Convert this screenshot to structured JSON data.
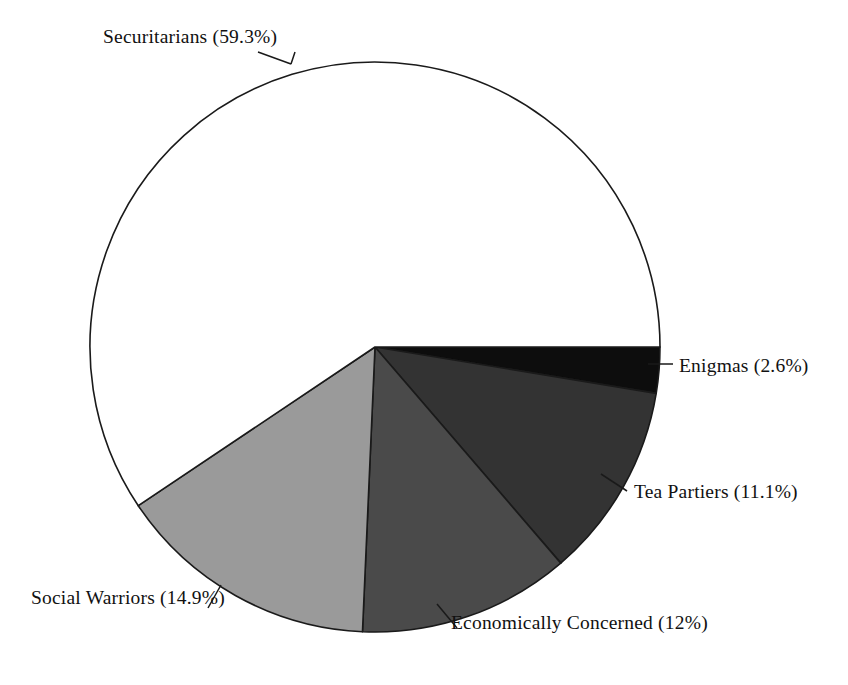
{
  "chart_data": {
    "type": "pie",
    "title": "",
    "subtitle": "",
    "xlabel": "",
    "ylabel": "",
    "legend_position": "none",
    "grid": false,
    "labels_outside": true,
    "start_angle_deg": 0,
    "direction": "clockwise",
    "categories": [
      "Enigmas",
      "Tea Partiers",
      "Economically Concerned",
      "Social Warriors",
      "Securitarians"
    ],
    "values": [
      2.6,
      11.1,
      12,
      14.9,
      59.3
    ],
    "units": "percent",
    "slices": [
      {
        "name": "Enigmas",
        "value": 2.6,
        "label": "Enigmas (2.6%)",
        "color": "#0d0d0d",
        "start_deg": 0,
        "end_deg": 9.36
      },
      {
        "name": "Tea Partiers",
        "value": 11.1,
        "label": "Tea Partiers (11.1%)",
        "color": "#333333",
        "start_deg": 9.36,
        "end_deg": 49.32
      },
      {
        "name": "Economically Concerned",
        "value": 12,
        "label": "Economically Concerned (12%)",
        "color": "#4a4a4a",
        "start_deg": 49.32,
        "end_deg": 92.52
      },
      {
        "name": "Social Warriors",
        "value": 14.9,
        "label": "Social Warriors (14.9%)",
        "color": "#9a9a9a",
        "start_deg": 92.52,
        "end_deg": 146.16
      },
      {
        "name": "Securitarians",
        "value": 59.3,
        "label": "Securitarians (59.3%)",
        "color": "#ffffff",
        "start_deg": 146.16,
        "end_deg": 360
      }
    ],
    "geometry": {
      "center_x": 375,
      "center_y": 347,
      "radius": 285,
      "stroke_color": "#1a1a1a"
    }
  }
}
